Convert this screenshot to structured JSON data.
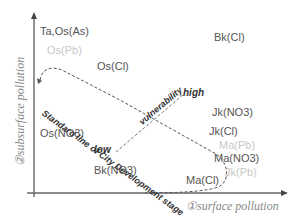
{
  "diagram": {
    "axes": {
      "x_title": "①surface pollution",
      "y_title": "②subsurface pollution"
    },
    "points": [
      {
        "label": "Ta,Os(As)",
        "style": "normal"
      },
      {
        "label": "Os(Pb)",
        "style": "faint"
      },
      {
        "label": "Os(Cl)",
        "style": "normal"
      },
      {
        "label": "Bk(Cl)",
        "style": "normal"
      },
      {
        "label": "Os(NO3)",
        "style": "normal"
      },
      {
        "label": "Bk(NO3)",
        "style": "normal"
      },
      {
        "label": "Jk(NO3)",
        "style": "normal"
      },
      {
        "label": "Jk(Cl)",
        "style": "normal"
      },
      {
        "label": "Ma(Pb)",
        "style": "faint"
      },
      {
        "label": "Ma(NO3)",
        "style": "normal"
      },
      {
        "label": "Jk(Pb)",
        "style": "faint"
      },
      {
        "label": "Ma(Cl)",
        "style": "normal"
      }
    ],
    "annotations": {
      "standard_line": "Standard line of City Development stage",
      "vulnerability": "vulnerability",
      "high": "high",
      "low": "low"
    },
    "colors": {
      "axis": "#555555",
      "text": "#555555",
      "faint_text": "#c8c8c8",
      "dashed": "#555555",
      "annotation": "#333333"
    }
  }
}
